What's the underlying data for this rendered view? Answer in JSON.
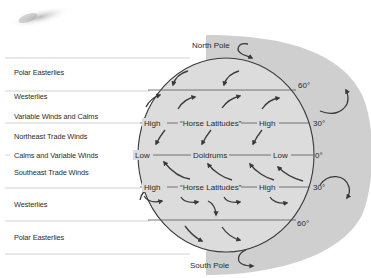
{
  "diagram": {
    "colors": {
      "globe_fill": "#dcdcdc",
      "backdrop_fill": "#cfcfcf",
      "line": "#3a3a3a",
      "row_rule": "#c8c8c8",
      "text": "#2b2b2b"
    },
    "poles": {
      "north": "North Pole",
      "south": "South Pole"
    },
    "left_bands": [
      {
        "label": "Polar Easterlies"
      },
      {
        "label": "Westerlies"
      },
      {
        "label": "Variable Winds and Calms"
      },
      {
        "label": "Northeast Trade Winds"
      },
      {
        "label": "Calms and Variable Winds"
      },
      {
        "label": "Southeast Trade Winds"
      },
      {
        "label": "Westerlies"
      },
      {
        "label": "Polar Easterlies"
      }
    ],
    "latitude_lines": [
      {
        "label": "60°",
        "position": "north"
      },
      {
        "label": "30°",
        "position": "north"
      },
      {
        "label": "0°",
        "position": "equator"
      },
      {
        "label": "30°",
        "position": "south"
      },
      {
        "label": "60°",
        "position": "south"
      }
    ],
    "pressure_labels": {
      "north_30": {
        "left": "High",
        "center": "“Horse Latitudes”",
        "right": "High"
      },
      "equator": {
        "left": "Low",
        "center": "Doldrums",
        "right": "Low"
      },
      "south_30": {
        "left": "High",
        "center": "“Horse Latitudes”",
        "right": "High"
      }
    }
  }
}
